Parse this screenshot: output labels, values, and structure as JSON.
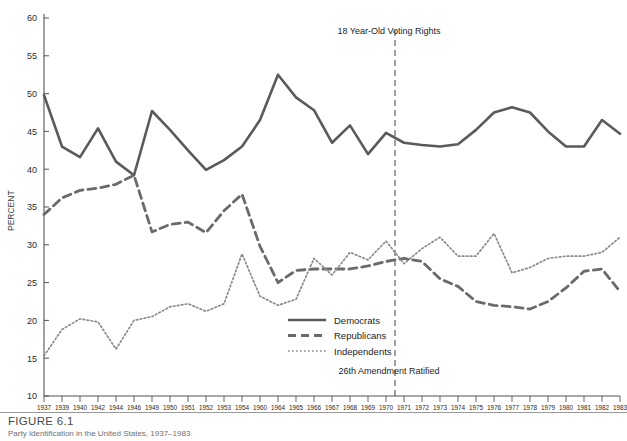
{
  "caption": {
    "figure_label": "FIGURE 6.1",
    "subtitle": "Party Identification in the United States, 1937–1983"
  },
  "chart_data": {
    "type": "line",
    "title": "",
    "xlabel": "",
    "ylabel": "PERCENT",
    "ylim": [
      10,
      60
    ],
    "ytick_step": 5,
    "yticks": [
      10,
      15,
      20,
      25,
      30,
      35,
      40,
      45,
      50,
      55,
      60
    ],
    "grid": false,
    "legend_position": "inside-lower-center",
    "categories": [
      "1937",
      "1939",
      "1940",
      "1942",
      "1944",
      "1946",
      "1949",
      "1950",
      "1951",
      "1952",
      "1953",
      "1954",
      "1960",
      "1964",
      "1965",
      "1966",
      "1967",
      "1968",
      "1969",
      "1970",
      "1971",
      "1972",
      "1973",
      "1974",
      "1975",
      "1976",
      "1977",
      "1978",
      "1979",
      "1980",
      "1981",
      "1982",
      "1983"
    ],
    "series": [
      {
        "name": "Democrats",
        "style": "solid",
        "color": "#5a5a5a",
        "values": [
          49.8,
          43.0,
          41.6,
          45.4,
          41.0,
          39.2,
          47.7,
          45.2,
          42.5,
          39.9,
          41.2,
          43.0,
          46.5,
          52.5,
          49.5,
          47.8,
          43.5,
          45.8,
          42.0,
          44.8,
          43.5,
          43.2,
          43.0,
          43.3,
          45.2,
          47.5,
          48.2,
          47.5,
          45.0,
          43.0,
          43.0,
          46.5,
          44.7
        ]
      },
      {
        "name": "Republicans",
        "style": "dashed",
        "color": "#6a6a6a",
        "values": [
          34.0,
          36.2,
          37.2,
          37.5,
          38.0,
          39.2,
          31.7,
          32.7,
          33.0,
          31.6,
          34.5,
          36.7,
          29.8,
          25.0,
          26.6,
          26.8,
          26.8,
          26.8,
          27.2,
          27.8,
          28.2,
          27.8,
          25.5,
          24.5,
          22.5,
          22.0,
          21.8,
          21.5,
          22.5,
          24.3,
          26.5,
          26.8,
          23.8
        ]
      },
      {
        "name": "Independents",
        "style": "dotted",
        "color": "#8a8a8a",
        "values": [
          15.3,
          18.8,
          20.2,
          19.8,
          16.2,
          20.0,
          20.5,
          21.8,
          22.2,
          21.2,
          22.2,
          28.8,
          23.2,
          22.0,
          22.8,
          28.2,
          26.0,
          29.0,
          28.0,
          30.5,
          27.5,
          29.5,
          31.0,
          28.5,
          28.5,
          31.5,
          26.3,
          27.0,
          28.2,
          28.5,
          28.5,
          29.0,
          31.0
        ]
      }
    ],
    "annotations": [
      {
        "id": "voting-rights",
        "text": "18 Year-Old Voting Rights",
        "x_between": [
          "1970",
          "1971"
        ],
        "position": "top"
      },
      {
        "id": "amendment",
        "text": "26th Amendment Ratified",
        "x_between": [
          "1970",
          "1971"
        ],
        "position": "bottom"
      }
    ],
    "reference_line": {
      "id": "1971-marker",
      "style": "dashed",
      "x_between": [
        "1970",
        "1971"
      ]
    }
  }
}
